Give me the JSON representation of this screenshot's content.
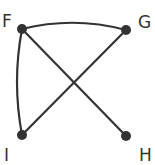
{
  "diagram": {
    "type": "graph",
    "nodes": [
      {
        "id": "F",
        "label": "F",
        "x": 22,
        "y": 29
      },
      {
        "id": "G",
        "label": "G",
        "x": 126,
        "y": 30
      },
      {
        "id": "I",
        "label": "I",
        "x": 22,
        "y": 135
      },
      {
        "id": "H",
        "label": "H",
        "x": 126,
        "y": 136
      }
    ],
    "edges": [
      {
        "from": "F",
        "to": "G"
      },
      {
        "from": "F",
        "to": "H"
      },
      {
        "from": "F",
        "to": "I"
      },
      {
        "from": "G",
        "to": "I"
      }
    ],
    "colors": {
      "node": "#333333",
      "edge": "#333333",
      "background": "#ffffff"
    }
  }
}
